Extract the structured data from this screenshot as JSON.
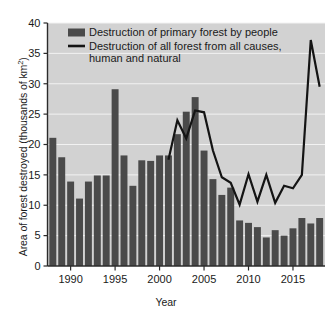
{
  "chart_data": {
    "type": "bar",
    "title": "",
    "xlabel": "Year",
    "ylabel": "Area of forest destroyed (thousands of km²)",
    "ylim": [
      0,
      40
    ],
    "xlim": [
      1987.4,
      2018.6
    ],
    "yticks": [
      0,
      5,
      10,
      15,
      20,
      25,
      30,
      35,
      40
    ],
    "ytick_labels": [
      "0",
      "5",
      "10",
      "15",
      "20",
      "25",
      "30",
      "35",
      "40"
    ],
    "xticks": [
      1990,
      1995,
      2000,
      2005,
      2010,
      2015
    ],
    "xtick_labels": [
      "1990",
      "1995",
      "2000",
      "2005",
      "2010",
      "2015"
    ],
    "grid": "horizontal-white-on-gray",
    "plot_background": "#d2d2d2",
    "bar_color": "#4a4a4a",
    "line_color": "#141414",
    "legend_position": "top-left-inside",
    "legend": [
      {
        "key": "bars",
        "marker": "filled-rectangle",
        "label": "Destruction of primary forest by people"
      },
      {
        "key": "line",
        "marker": "solid-line",
        "label": "Destruction of all forest from all causes, human and natural"
      }
    ],
    "categories": [
      1988,
      1989,
      1990,
      1991,
      1992,
      1993,
      1994,
      1995,
      1996,
      1997,
      1998,
      1999,
      2000,
      2001,
      2002,
      2003,
      2004,
      2005,
      2006,
      2007,
      2008,
      2009,
      2010,
      2011,
      2012,
      2013,
      2014,
      2015,
      2016,
      2017,
      2018
    ],
    "series": [
      {
        "name": "Destruction of primary forest by people",
        "type": "bar",
        "values": [
          21.1,
          17.9,
          13.9,
          11.1,
          13.9,
          14.9,
          14.9,
          29.1,
          18.2,
          13.2,
          17.4,
          17.3,
          18.2,
          18.2,
          21.7,
          25.4,
          27.8,
          19.0,
          14.3,
          11.7,
          12.9,
          7.5,
          7.1,
          6.4,
          4.7,
          5.9,
          5.0,
          6.2,
          7.9,
          7.0,
          7.9
        ]
      },
      {
        "name": "Destruction of all forest from all causes, human and natural",
        "type": "line",
        "x": [
          2001,
          2002,
          2003,
          2004,
          2005,
          2006,
          2007,
          2008,
          2009,
          2010,
          2011,
          2012,
          2013,
          2014,
          2015,
          2016,
          2017,
          2018
        ],
        "values": [
          17.5,
          24.0,
          21.0,
          25.6,
          25.3,
          19.0,
          14.6,
          13.7,
          10.1,
          15.1,
          10.6,
          15.0,
          10.4,
          13.2,
          12.8,
          15.0,
          37.2,
          29.5
        ]
      }
    ]
  }
}
